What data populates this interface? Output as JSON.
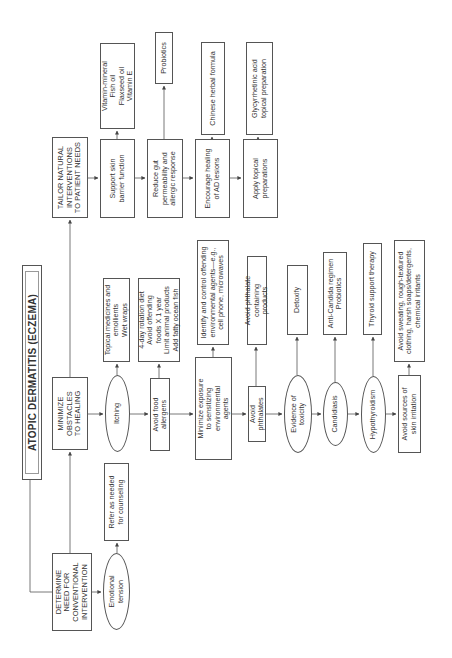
{
  "title": "ATOPIC DERMATITIS (ECZEMA)",
  "main_steps": {
    "determine": "DETERMINE\nNEED FOR\nCONVENTIONAL\nINTERVENTION",
    "minimize": "MINIMIZE\nOBSTACLES\nTO HEALING",
    "tailor": "TAILOR NATURAL\nINTERVENTIONS\nTO PATIENT NEEDS"
  },
  "determine_branch": {
    "emotional_tension": "Emotional\ntension",
    "refer_counseling": "Refer as needed\nfor counseling"
  },
  "minimize_branch": {
    "itching": "Itching",
    "itching_action": "Topical medicines and\nemollients\nWet wraps",
    "food_allergens": "Avoid food\nallergens",
    "food_action": "4-day rotation diet\nAvoid offending\nfoods X 1 year\nLimit animal products\nAdd fatty ocean fish",
    "env_agents": "Minimize exposure\nto sensitizing\nenvironmental\nagents",
    "env_action": "Identify and control offending\nenvironmental agents—e.g.,\ncell phone, microwaves",
    "phthalates": "Avoid phthalates",
    "phthalates_action": "Avoid phthalate containing\nproducts",
    "toxicity": "Evidence of\ntoxicity",
    "toxicity_action": "Detoxify",
    "candidiasis": "Candidiasis",
    "candidiasis_action": "Anti-Candida regimen\nProbiotics",
    "hypothyroidism": "Hypothyroidism",
    "hypothyroidism_action": "Thyroid support therapy",
    "skin_irritation": "Avoid sources of\nskin irritation",
    "skin_irritation_action": "Avoid sweating, rough-textured\nclothing, harsh soaps/detergents,\nchemical irritants"
  },
  "tailor_branch": {
    "skin_barrier": "Support skin\nbarrier function",
    "skin_barrier_action": "Vitamin-mineral\nFish oil\nFlaxseed oil\nVitamin E",
    "gut": "Reduce gut\npermeability and\nallergic response",
    "gut_action": "Probiotics",
    "lesions": "Encourage healing\nof AD lesions",
    "lesions_action": "Chinese herbal formula",
    "topical": "Apply topical\npreparations",
    "topical_action": "Glycyrrhetinic acid\ntopical preparation"
  }
}
